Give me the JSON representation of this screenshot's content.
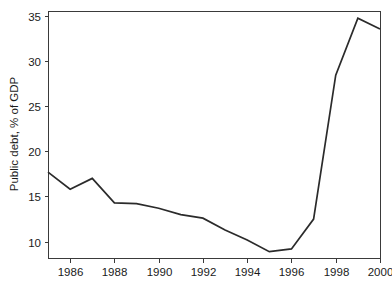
{
  "chart_data": {
    "type": "line",
    "title": "",
    "subtitle": "",
    "xlabel": "",
    "ylabel": "Public debt, % of GDP",
    "xlim": [
      1985,
      2000
    ],
    "ylim": [
      8.2,
      35.5
    ],
    "grid": false,
    "legend": null,
    "legend_position": "none",
    "x_ticks": [
      1986,
      1988,
      1990,
      1992,
      1994,
      1996,
      1998,
      2000
    ],
    "x_tick_labels": [
      "1986",
      "1988",
      "1990",
      "1992",
      "1994",
      "1996",
      "1998",
      "2000"
    ],
    "y_ticks": [
      10,
      15,
      20,
      25,
      30,
      35
    ],
    "y_tick_labels": [
      "10",
      "15",
      "20",
      "25",
      "30",
      "35"
    ],
    "line_color": "#2b2b2b",
    "axis_color": "#3a3a3a",
    "background_color": "#ffffff",
    "x": [
      1985,
      1986,
      1987,
      1988,
      1989,
      1990,
      1991,
      1992,
      1993,
      1994,
      1995,
      1996,
      1997,
      1998,
      1999,
      2000
    ],
    "series": [
      {
        "name": "Public debt",
        "values": [
          17.7,
          15.8,
          17.0,
          14.3,
          14.2,
          13.7,
          13.0,
          12.6,
          11.3,
          10.2,
          8.9,
          9.2,
          12.5,
          28.4,
          34.7,
          33.5
        ]
      }
    ],
    "annotations": []
  },
  "figure": {
    "accent_color": "#2b2b2b",
    "plot_area": {
      "left": 48,
      "top": 11,
      "right": 380,
      "bottom": 258
    }
  }
}
